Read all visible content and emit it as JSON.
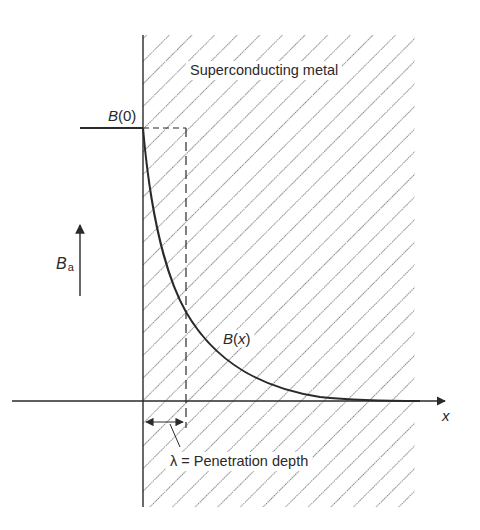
{
  "diagram": {
    "title_label": "Superconducting metal",
    "b0_label": {
      "symbol": "B",
      "arg": "(0)"
    },
    "bx_label": {
      "symbol": "B",
      "open": "(",
      "var": "x",
      "close": ")"
    },
    "ba_label": {
      "symbol": "B",
      "subscript": "a"
    },
    "x_axis_label": "x",
    "lambda_label": "λ = Penetration depth",
    "colors": {
      "line": "#2a2a2a",
      "hatch": "#3a3a3a",
      "background": "#ffffff"
    },
    "geometry": {
      "metal_left_x": 143,
      "metal_top_y": 35,
      "metal_right_x": 415,
      "metal_bottom_y": 507,
      "b0_y": 128,
      "axis_y": 401,
      "lambda_x": 186,
      "hatch_spacing": 16
    }
  }
}
